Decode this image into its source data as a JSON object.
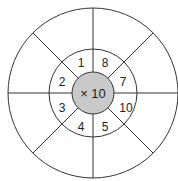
{
  "diagram": {
    "center_label": "× 10",
    "inner_fill": "#c9c9c9",
    "stroke": "#333333",
    "numbers": [
      {
        "value": "1",
        "x": 81,
        "y": 67
      },
      {
        "value": "8",
        "x": 105,
        "y": 67
      },
      {
        "value": "7",
        "x": 123,
        "y": 85
      },
      {
        "value": "10",
        "x": 126,
        "y": 111
      },
      {
        "value": "5",
        "x": 105,
        "y": 130
      },
      {
        "value": "4",
        "x": 81,
        "y": 130
      },
      {
        "value": "2",
        "x": 62,
        "y": 85
      },
      {
        "value": "3",
        "x": 62,
        "y": 111
      }
    ]
  }
}
